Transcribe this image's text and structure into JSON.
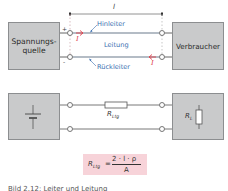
{
  "diagram": {
    "dimension": {
      "label": "l"
    },
    "top_circuit": {
      "source_box": {
        "line1": "Spannungs-",
        "line2": "quelle"
      },
      "load_box": {
        "label": "Verbraucher"
      },
      "plus_sign": "+",
      "minus_sign": "-",
      "outgoing_conductor": "Hinleiter",
      "line_label": "Leitung",
      "return_conductor": "Rückleiter",
      "current_symbol": "I"
    },
    "bottom_circuit": {
      "line_resistance": {
        "symbol": "R",
        "subscript": "Ltg"
      },
      "load_resistance": {
        "symbol": "R",
        "subscript": "L"
      }
    },
    "formula": {
      "lhs_symbol": "R",
      "lhs_subscript": "Ltg",
      "equals": "=",
      "numerator": "2 · l · ρ",
      "denominator": "A"
    },
    "caption": "Bild 2.12: Leiter und Leitung"
  },
  "colors": {
    "box_fill": "#c9cacb",
    "wire": "#6a7b8c",
    "label_blue": "#3a6fb0",
    "current_red": "#e0404a",
    "formula_bg": "#f7d3d9"
  }
}
